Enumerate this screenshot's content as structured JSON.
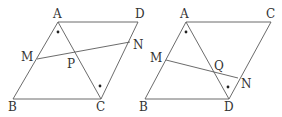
{
  "figures": [
    {
      "id": "left",
      "points": {
        "A": {
          "label": "A",
          "x": 58,
          "y": 22,
          "lx": 53,
          "ly": 18
        },
        "D": {
          "label": "D",
          "x": 138,
          "y": 22,
          "lx": 135,
          "ly": 18
        },
        "B": {
          "label": "B",
          "x": 13,
          "y": 99,
          "lx": 8,
          "ly": 111
        },
        "C": {
          "label": "C",
          "x": 101,
          "y": 99,
          "lx": 96,
          "ly": 111
        },
        "M": {
          "label": "M",
          "x": 37,
          "y": 59,
          "lx": 21,
          "ly": 61
        },
        "N": {
          "label": "N",
          "x": 130,
          "y": 42,
          "lx": 133,
          "ly": 49
        },
        "P": {
          "label": "P",
          "x": 76,
          "y": 52,
          "lx": 67,
          "ly": 68
        }
      },
      "segments": [
        [
          "A",
          "D"
        ],
        [
          "A",
          "B"
        ],
        [
          "B",
          "C"
        ],
        [
          "D",
          "C"
        ],
        [
          "A",
          "C"
        ],
        [
          "M",
          "N"
        ]
      ],
      "angle_marks": [
        {
          "x": 58,
          "y": 32
        },
        {
          "x": 100,
          "y": 86
        }
      ]
    },
    {
      "id": "right",
      "points": {
        "A": {
          "label": "A",
          "x": 186,
          "y": 22,
          "lx": 180,
          "ly": 18
        },
        "C": {
          "label": "C",
          "x": 271,
          "y": 22,
          "lx": 266,
          "ly": 18
        },
        "B": {
          "label": "B",
          "x": 145,
          "y": 99,
          "lx": 139,
          "ly": 111
        },
        "D": {
          "label": "D",
          "x": 229,
          "y": 99,
          "lx": 224,
          "ly": 111
        },
        "M": {
          "label": "M",
          "x": 166,
          "y": 60,
          "lx": 150,
          "ly": 62
        },
        "N": {
          "label": "N",
          "x": 238,
          "y": 78,
          "lx": 241,
          "ly": 88
        },
        "Q": {
          "label": "Q",
          "x": 213,
          "y": 72,
          "lx": 214,
          "ly": 70
        }
      },
      "segments": [
        [
          "A",
          "C"
        ],
        [
          "A",
          "B"
        ],
        [
          "B",
          "D"
        ],
        [
          "C",
          "D"
        ],
        [
          "A",
          "D"
        ],
        [
          "M",
          "N"
        ]
      ],
      "angle_marks": [
        {
          "x": 186,
          "y": 32
        },
        {
          "x": 228,
          "y": 87
        }
      ]
    }
  ],
  "colors": {
    "line": "#5a5a5a",
    "text": "#333333",
    "dot": "#222222"
  }
}
